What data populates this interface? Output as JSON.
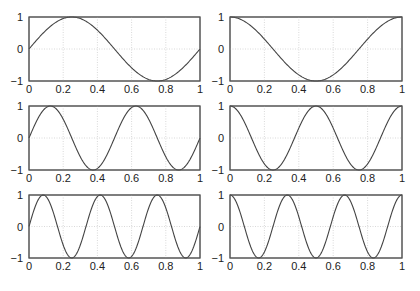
{
  "chart_data": [
    {
      "type": "line",
      "title": "",
      "xlabel": "",
      "ylabel": "",
      "function": "sin(2*pi*x)",
      "series": [
        {
          "name": "sin(2πx)",
          "frequency": 1,
          "phase": "sin"
        }
      ],
      "x_range": [
        0,
        1
      ],
      "ylim": [
        -1,
        1
      ],
      "xticks": [
        "0",
        "0.2",
        "0.4",
        "0.6",
        "0.8",
        "1"
      ],
      "yticks": [
        "1",
        "0",
        "−1"
      ],
      "grid": true
    },
    {
      "type": "line",
      "title": "",
      "xlabel": "",
      "ylabel": "",
      "function": "cos(2*pi*x)",
      "series": [
        {
          "name": "cos(2πx)",
          "frequency": 1,
          "phase": "cos"
        }
      ],
      "x_range": [
        0,
        1
      ],
      "ylim": [
        -1,
        1
      ],
      "xticks": [
        "0",
        "0.2",
        "0.4",
        "0.6",
        "0.8",
        "1"
      ],
      "yticks": [
        "1",
        "0",
        "−1"
      ],
      "grid": true
    },
    {
      "type": "line",
      "title": "",
      "xlabel": "",
      "ylabel": "",
      "function": "sin(4*pi*x)",
      "series": [
        {
          "name": "sin(4πx)",
          "frequency": 2,
          "phase": "sin"
        }
      ],
      "x_range": [
        0,
        1
      ],
      "ylim": [
        -1,
        1
      ],
      "xticks": [
        "0",
        "0.2",
        "0.4",
        "0.6",
        "0.8",
        "1"
      ],
      "yticks": [
        "1",
        "0",
        "−1"
      ],
      "grid": true
    },
    {
      "type": "line",
      "title": "",
      "xlabel": "",
      "ylabel": "",
      "function": "cos(4*pi*x)",
      "series": [
        {
          "name": "cos(4πx)",
          "frequency": 2,
          "phase": "cos"
        }
      ],
      "x_range": [
        0,
        1
      ],
      "ylim": [
        -1,
        1
      ],
      "xticks": [
        "0",
        "0.2",
        "0.4",
        "0.6",
        "0.8",
        "1"
      ],
      "yticks": [
        "1",
        "0",
        "−1"
      ],
      "grid": true
    },
    {
      "type": "line",
      "title": "",
      "xlabel": "",
      "ylabel": "",
      "function": "sin(6*pi*x)",
      "series": [
        {
          "name": "sin(6πx)",
          "frequency": 3,
          "phase": "sin"
        }
      ],
      "x_range": [
        0,
        1
      ],
      "ylim": [
        -1,
        1
      ],
      "xticks": [
        "0",
        "0.2",
        "0.4",
        "0.6",
        "0.8",
        "1"
      ],
      "yticks": [
        "1",
        "0",
        "−1"
      ],
      "grid": true
    },
    {
      "type": "line",
      "title": "",
      "xlabel": "",
      "ylabel": "",
      "function": "cos(6*pi*x)",
      "series": [
        {
          "name": "cos(6πx)",
          "frequency": 3,
          "phase": "cos"
        }
      ],
      "x_range": [
        0,
        1
      ],
      "ylim": [
        -1,
        1
      ],
      "xticks": [
        "0",
        "0.2",
        "0.4",
        "0.6",
        "0.8",
        "1"
      ],
      "yticks": [
        "1",
        "0",
        "−1"
      ],
      "grid": true
    }
  ],
  "colors": {
    "curve": "#444444",
    "grid": "#c8c8c8",
    "axis": "#555555"
  }
}
